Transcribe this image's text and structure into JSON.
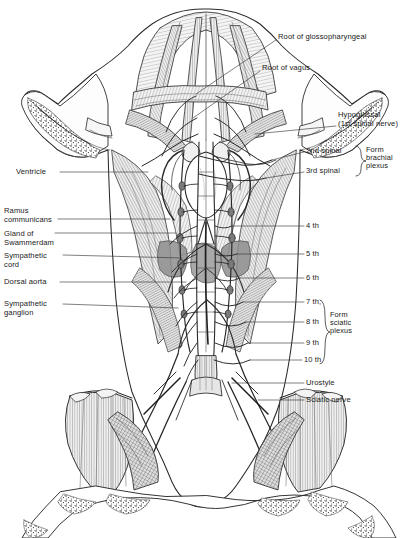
{
  "figure": {
    "caption": ""
  },
  "labels_left": [
    {
      "id": "ventricle",
      "text": "Ventricle",
      "x": 16,
      "y": 168,
      "lx1": 60,
      "ly1": 172,
      "lx2": 148,
      "ly2": 172
    },
    {
      "id": "ramus-communicans",
      "text": "Ramus\ncommunicans",
      "x": 4,
      "y": 207,
      "lx1": 58,
      "ly1": 219,
      "lx2": 170,
      "ly2": 219
    },
    {
      "id": "gland-of-swammerdam",
      "text": "Gland of\nSwammerdam",
      "x": 4,
      "y": 230,
      "lx1": 55,
      "ly1": 233,
      "lx2": 176,
      "ly2": 233
    },
    {
      "id": "sympathetic-cord",
      "text": "Sympathetic\ncord",
      "x": 4,
      "y": 252,
      "lx1": 63,
      "ly1": 255,
      "lx2": 182,
      "ly2": 258
    },
    {
      "id": "dorsal-aorta",
      "text": "Dorsal aorta",
      "x": 4,
      "y": 278,
      "lx1": 60,
      "ly1": 282,
      "lx2": 186,
      "ly2": 282
    },
    {
      "id": "sympathetic-ganglion",
      "text": "Sympathetic\nganglion",
      "x": 4,
      "y": 300,
      "lx1": 63,
      "ly1": 304,
      "lx2": 178,
      "ly2": 308
    }
  ],
  "labels_right": [
    {
      "id": "root-of-glossopharyngeal",
      "text": "Root of glossopharyngeal",
      "x": 278,
      "y": 33,
      "lx1": 276,
      "ly1": 40,
      "lx2": 196,
      "ly2": 94
    },
    {
      "id": "root-of-vagus",
      "text": "Root of vagus",
      "x": 262,
      "y": 64,
      "lx1": 260,
      "ly1": 71,
      "lx2": 193,
      "ly2": 118
    },
    {
      "id": "hypoglossal",
      "text": "Hypoglossal\n(1st spinal nerve)",
      "x": 338,
      "y": 111,
      "lx1": 336,
      "ly1": 126,
      "lx2": 255,
      "ly2": 134
    },
    {
      "id": "2nd-spinal",
      "text": "2nd spinal",
      "x": 306,
      "y": 147,
      "lx1": 304,
      "ly1": 152,
      "lx2": 272,
      "ly2": 160
    },
    {
      "id": "3rd-spinal",
      "text": "3rd spinal",
      "x": 306,
      "y": 167,
      "lx1": 304,
      "ly1": 172,
      "lx2": 266,
      "ly2": 178
    },
    {
      "id": "4th",
      "text": "4 th",
      "x": 306,
      "y": 222,
      "lx1": 304,
      "ly1": 226,
      "lx2": 232,
      "ly2": 226
    },
    {
      "id": "5th",
      "text": "5 th",
      "x": 306,
      "y": 250,
      "lx1": 304,
      "ly1": 254,
      "lx2": 237,
      "ly2": 254
    },
    {
      "id": "6th",
      "text": "6 th",
      "x": 306,
      "y": 274,
      "lx1": 304,
      "ly1": 278,
      "lx2": 240,
      "ly2": 278
    },
    {
      "id": "7th",
      "text": "7 th,",
      "x": 306,
      "y": 298,
      "lx1": 304,
      "ly1": 302,
      "lx2": 243,
      "ly2": 302
    },
    {
      "id": "8th",
      "text": "8 th",
      "x": 306,
      "y": 318,
      "lx1": 304,
      "ly1": 322,
      "lx2": 246,
      "ly2": 322
    },
    {
      "id": "9th",
      "text": "9 th",
      "x": 306,
      "y": 339,
      "lx1": 304,
      "ly1": 343,
      "lx2": 248,
      "ly2": 343
    },
    {
      "id": "10th",
      "text": "10 th",
      "x": 304,
      "y": 356,
      "lx1": 302,
      "ly1": 360,
      "lx2": 250,
      "ly2": 360
    },
    {
      "id": "urostyle",
      "text": "Urostyle",
      "x": 306,
      "y": 379,
      "lx1": 304,
      "ly1": 383,
      "lx2": 232,
      "ly2": 383
    },
    {
      "id": "sciatic-nerve",
      "text": "Sciatic nerve",
      "x": 306,
      "y": 396,
      "lx1": 304,
      "ly1": 400,
      "lx2": 258,
      "ly2": 400
    }
  ],
  "groups": [
    {
      "id": "form-brachial-plexus",
      "text": "Form\nbrachial\nplexus",
      "x": 366,
      "y": 146,
      "brace": {
        "x": 356,
        "top": 146,
        "bottom": 176
      }
    },
    {
      "id": "form-sciatic-plexus",
      "text": "Form\nsciatic\nplexus",
      "x": 330,
      "y": 311,
      "brace": {
        "x": 320,
        "top": 300,
        "bottom": 364
      }
    }
  ],
  "colors": {
    "ink": "#1a1a1a",
    "leader": "#3a3a3a",
    "tissue_light": "#e8e8e8",
    "tissue_mid": "#c9c9c9",
    "tissue_dark": "#9a9a9a",
    "paper": "#ffffff"
  }
}
